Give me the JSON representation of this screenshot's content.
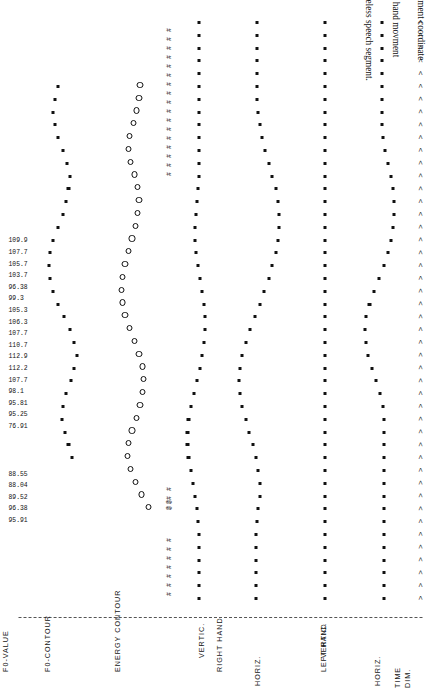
{
  "figure": {
    "number": "Figure 11.4",
    "caption_line1": "Multichannel behavior plot of hand movement coordinate measurements",
    "caption_f0": "F",
    "caption_f0_sub": "0",
    "caption_line2": ", and voice energy changes (preliminary version); +, hand movment coordinates in the",
    "caption_line3": "respective spatial dimensions; #, silent period; @, voiceless speech segment."
  },
  "columns": {
    "time": {
      "group": "TIME",
      "sub": "DIM."
    },
    "left_hand": {
      "group": "LEFT HAND",
      "horiz": "HORIZ.",
      "vertic": "VERTIC."
    },
    "right_hand": {
      "group": "RIGHT HAND",
      "horiz": "HORIZ.",
      "vertic": "VERTIC."
    },
    "energy": {
      "group": "ENERGY CONTOUR"
    },
    "f0_contour": {
      "group": "F0-CONTOUR"
    },
    "f0_value": {
      "group": "F0-VALUE"
    }
  },
  "symbols": {
    "hand_coordinate": "+",
    "silent_period": "#",
    "voiceless_segment": "@",
    "time_tick": ">"
  },
  "chart_data": {
    "type": "scatter",
    "title": "Multichannel behavior plot",
    "xlabel": "TIME DIM.",
    "ylabel": "",
    "grid": false,
    "legend": [
      "+, hand movement coordinates",
      "#, silent period",
      "@, voiceless speech segment"
    ],
    "n_time_steps": 46,
    "series": [
      {
        "name": "LEFT HAND HORIZ.",
        "marker": "+",
        "values": [
          0.5,
          0.5,
          0.5,
          0.5,
          0.5,
          0.5,
          0.5,
          0.5,
          0.5,
          0.5,
          0.5,
          0.5,
          0.5,
          0.5,
          0.5,
          0.52,
          0.58,
          0.66,
          0.74,
          0.8,
          0.84,
          0.86,
          0.84,
          0.78,
          0.7,
          0.6,
          0.5,
          0.42,
          0.36,
          0.32,
          0.3,
          0.3,
          0.32,
          0.36,
          0.42,
          0.48,
          0.52,
          0.54,
          0.54,
          0.54,
          0.54,
          0.54,
          0.54,
          0.54,
          0.54,
          0.54
        ]
      },
      {
        "name": "LEFT HAND VERTIC.",
        "marker": "+",
        "values": [
          0.5,
          0.5,
          0.5,
          0.5,
          0.5,
          0.5,
          0.5,
          0.5,
          0.5,
          0.5,
          0.5,
          0.5,
          0.5,
          0.5,
          0.5,
          0.5,
          0.5,
          0.5,
          0.5,
          0.5,
          0.5,
          0.5,
          0.5,
          0.5,
          0.5,
          0.5,
          0.5,
          0.5,
          0.5,
          0.5,
          0.5,
          0.5,
          0.5,
          0.5,
          0.5,
          0.5,
          0.5,
          0.5,
          0.5,
          0.5,
          0.5,
          0.5,
          0.5,
          0.5,
          0.5,
          0.5
        ]
      },
      {
        "name": "RIGHT HAND HORIZ.",
        "marker": "+",
        "values": [
          0.62,
          0.62,
          0.62,
          0.62,
          0.62,
          0.62,
          0.6,
          0.58,
          0.56,
          0.56,
          0.58,
          0.62,
          0.68,
          0.74,
          0.8,
          0.86,
          0.9,
          0.92,
          0.9,
          0.86,
          0.8,
          0.72,
          0.64,
          0.56,
          0.48,
          0.4,
          0.34,
          0.28,
          0.24,
          0.22,
          0.22,
          0.24,
          0.28,
          0.34,
          0.4,
          0.46,
          0.52,
          0.56,
          0.58,
          0.6,
          0.6,
          0.6,
          0.6,
          0.6,
          0.6,
          0.6
        ]
      },
      {
        "name": "RIGHT HAND VERTIC.",
        "marker": "+",
        "values": [
          0.55,
          0.55,
          0.55,
          0.55,
          0.55,
          0.56,
          0.58,
          0.6,
          0.64,
          0.68,
          0.72,
          0.76,
          0.78,
          0.78,
          0.76,
          0.72,
          0.66,
          0.6,
          0.54,
          0.5,
          0.46,
          0.44,
          0.44,
          0.46,
          0.5,
          0.54,
          0.58,
          0.62,
          0.64,
          0.64,
          0.62,
          0.6,
          0.58,
          0.56,
          0.55,
          0.55,
          0.55,
          0.55,
          0.55,
          0.55,
          0.55,
          0.55,
          0.55,
          0.55,
          0.55,
          0.55
        ]
      },
      {
        "name": "ENERGY CONTOUR",
        "marker": "o",
        "values": [
          null,
          null,
          null,
          null,
          null,
          null,
          null,
          0.3,
          0.42,
          0.52,
          0.6,
          0.66,
          0.64,
          0.58,
          0.5,
          0.44,
          0.4,
          0.38,
          0.4,
          0.46,
          0.54,
          0.62,
          0.7,
          0.74,
          0.76,
          0.74,
          0.7,
          0.64,
          0.58,
          0.52,
          0.48,
          0.46,
          0.48,
          0.54,
          0.6,
          0.64,
          0.62,
          0.56,
          0.5,
          0.46,
          0.44,
          null,
          null,
          null,
          null,
          null
        ]
      },
      {
        "name": "F0-CONTOUR",
        "marker": "■",
        "values": [
          null,
          null,
          null,
          null,
          null,
          null,
          null,
          null,
          null,
          null,
          null,
          0.38,
          0.44,
          0.5,
          0.56,
          0.54,
          0.48,
          0.4,
          0.34,
          0.3,
          0.34,
          0.42,
          0.52,
          0.62,
          0.7,
          0.76,
          0.78,
          0.76,
          0.7,
          0.62,
          0.54,
          0.48,
          0.44,
          0.42,
          0.46,
          0.54,
          0.62,
          0.68,
          0.7,
          0.68,
          0.62,
          null,
          null,
          null,
          null,
          null
        ]
      }
    ],
    "f0_values": [
      "95.91",
      "96.38",
      "89.52",
      "88.04",
      "88.55",
      "76.91",
      "95.25",
      "95.81",
      "98.1",
      "107.7",
      "112.2",
      "112.9",
      "110.7",
      "107.7",
      "106.3",
      "105.3",
      "99.3",
      "96.38",
      "103.7",
      "105.7",
      "107.7",
      "109.9"
    ],
    "silent_markers_count": 7,
    "voiceless_markers_count": 2
  }
}
